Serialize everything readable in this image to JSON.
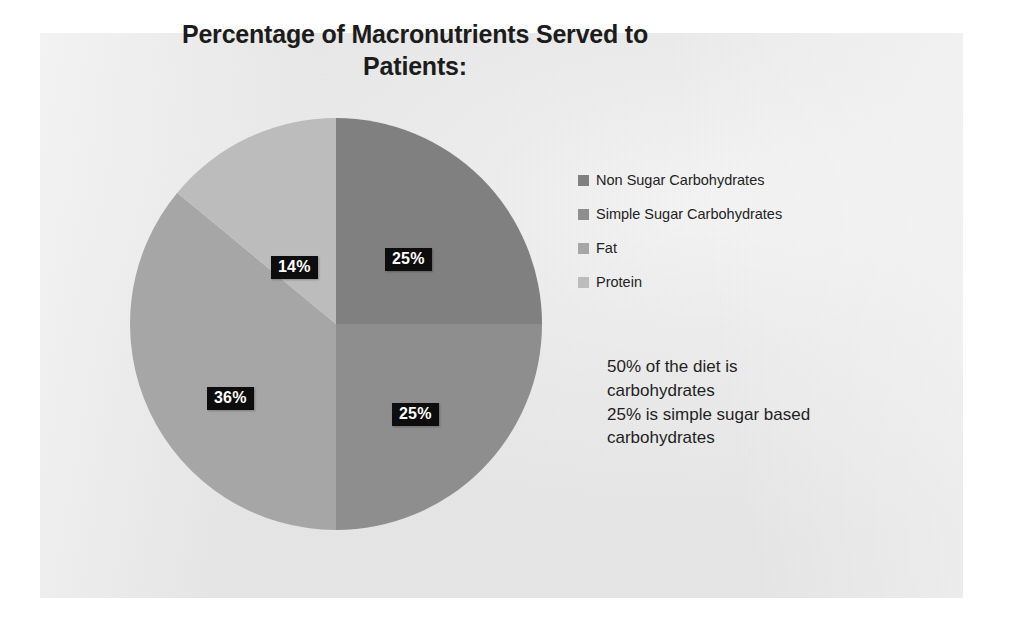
{
  "slide": {
    "title_line1": "Percentage of Macronutrients Served to",
    "title_line2": "Patients:"
  },
  "legend": {
    "items": [
      {
        "label": "Non Sugar Carbohydrates",
        "color": "#808080"
      },
      {
        "label": "Simple Sugar Carbohydrates",
        "color": "#8e8e8e"
      },
      {
        "label": "Fat",
        "color": "#a6a6a6"
      },
      {
        "label": "Protein",
        "color": "#bcbcbc"
      }
    ]
  },
  "annotation": {
    "line1": "50% of the diet is",
    "line2": "carbohydrates",
    "line3": "25% is simple sugar based",
    "line4": "carbohydrates"
  },
  "labels": {
    "top_right": "25%",
    "bottom_right": "25%",
    "left": "36%",
    "top_left": "14%"
  },
  "chart_data": {
    "type": "pie",
    "title": "Percentage of Macronutrients Served to Patients:",
    "categories": [
      "Non Sugar Carbohydrates",
      "Simple Sugar Carbohydrates",
      "Fat",
      "Protein"
    ],
    "values": [
      25,
      25,
      36,
      14
    ],
    "value_labels": [
      "25%",
      "25%",
      "36%",
      "14%"
    ],
    "colors": [
      "#808080",
      "#8e8e8e",
      "#a6a6a6",
      "#bcbcbc"
    ],
    "units": "percent",
    "total": 100,
    "start_angle_deg": 0,
    "direction": "clockwise",
    "legend_position": "right",
    "grid": false,
    "annotations": [
      "50% of the diet is carbohydrates",
      "25% is simple sugar based carbohydrates"
    ]
  }
}
